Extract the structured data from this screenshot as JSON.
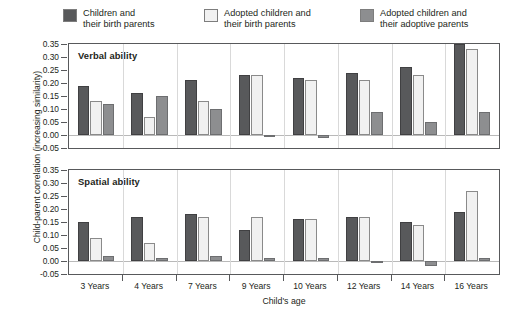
{
  "legend": {
    "items": [
      {
        "label_line1": "Children and",
        "label_line2": "their birth parents",
        "color": "#58595b",
        "key": "children-birth-parents"
      },
      {
        "label_line1": "Adopted children and",
        "label_line2": "their birth parents",
        "color": "#f1f1f1",
        "key": "adopted-birth-parents"
      },
      {
        "label_line1": "Adopted children and",
        "label_line2": "their adoptive parents",
        "color": "#8d8e90",
        "key": "adopted-adoptive-parents"
      }
    ]
  },
  "axes": {
    "ylabel": "Child-parent correlation (increasing similarity)",
    "xlabel": "Child's age",
    "yticks": [
      "0.35",
      "0.30",
      "0.25",
      "0.20",
      "0.15",
      "0.10",
      "0.05",
      "0.00",
      "-0.05"
    ],
    "xticklabels": [
      "3 Years",
      "4 Years",
      "7 Years",
      "9 Years",
      "10 Years",
      "12 Years",
      "14 Years",
      "16 Years"
    ]
  },
  "panels": [
    {
      "key": "verbal",
      "title": "Verbal ability"
    },
    {
      "key": "spatial",
      "title": "Spatial ability"
    }
  ],
  "chart_data": [
    {
      "type": "bar",
      "title": "Verbal ability",
      "xlabel": "Child's age",
      "ylabel": "Child-parent correlation (increasing similarity)",
      "ylim": [
        -0.05,
        0.35
      ],
      "ytick_step": 0.05,
      "grid": false,
      "legend_position": "top",
      "categories": [
        "3 Years",
        "4 Years",
        "7 Years",
        "9 Years",
        "10 Years",
        "12 Years",
        "14 Years",
        "16 Years"
      ],
      "series": [
        {
          "name": "Children and their birth parents",
          "color": "#58595b",
          "values": [
            0.19,
            0.16,
            0.21,
            0.23,
            0.22,
            0.24,
            0.26,
            0.35
          ]
        },
        {
          "name": "Adopted children and their birth parents",
          "color": "#f1f1f1",
          "values": [
            0.13,
            0.07,
            0.13,
            0.23,
            0.21,
            0.21,
            0.23,
            0.33
          ]
        },
        {
          "name": "Adopted children and their adoptive parents",
          "color": "#8d8e90",
          "values": [
            0.12,
            0.15,
            0.1,
            0.0,
            -0.01,
            0.09,
            0.05,
            0.09
          ]
        }
      ]
    },
    {
      "type": "bar",
      "title": "Spatial ability",
      "xlabel": "Child's age",
      "ylabel": "Child-parent correlation (increasing similarity)",
      "ylim": [
        -0.05,
        0.35
      ],
      "ytick_step": 0.05,
      "grid": false,
      "legend_position": "top",
      "categories": [
        "3 Years",
        "4 Years",
        "7 Years",
        "9 Years",
        "10 Years",
        "12 Years",
        "14 Years",
        "16 Years"
      ],
      "series": [
        {
          "name": "Children and their birth parents",
          "color": "#58595b",
          "values": [
            0.15,
            0.17,
            0.18,
            0.12,
            0.16,
            0.17,
            0.15,
            0.19
          ]
        },
        {
          "name": "Adopted children and their birth parents",
          "color": "#f1f1f1",
          "values": [
            0.09,
            0.07,
            0.17,
            0.17,
            0.16,
            0.17,
            0.14,
            0.27
          ]
        },
        {
          "name": "Adopted children and their adoptive parents",
          "color": "#8d8e90",
          "values": [
            0.02,
            0.01,
            0.02,
            0.01,
            0.01,
            0.0,
            -0.02,
            0.01
          ]
        }
      ]
    }
  ]
}
